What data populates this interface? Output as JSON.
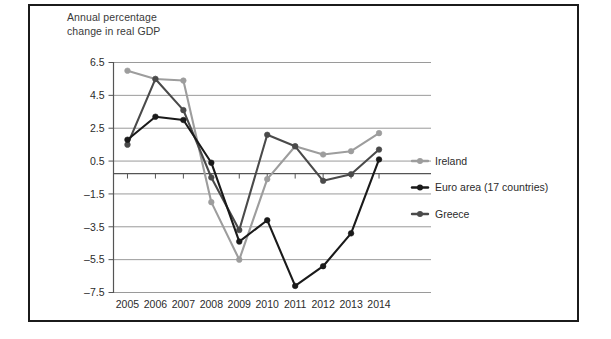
{
  "axis_title": "Annual percentage\nchange in real GDP",
  "legend": {
    "position": "right",
    "entries": [
      {
        "label": "Ireland",
        "color": "#9d9d9d"
      },
      {
        "label": "Euro area (17 countries)",
        "color": "#1a1a1a"
      },
      {
        "label": "Greece",
        "color": "#4a4a4a"
      }
    ]
  },
  "chart_data": {
    "type": "line",
    "title": "Annual percentage change in real GDP",
    "xlabel": "",
    "ylabel": "Annual percentage change in real GDP",
    "categories": [
      "2005",
      "2006",
      "2007",
      "2008",
      "2009",
      "2010",
      "2011",
      "2012",
      "2013",
      "2014"
    ],
    "ylim": [
      -7.5,
      6.5
    ],
    "yticks": [
      6.5,
      4.5,
      2.5,
      0.5,
      -1.5,
      -3.5,
      -5.5,
      -7.5
    ],
    "ytick_labels": [
      "6.5",
      "4.5",
      "2.5",
      "0.5",
      "–1.5",
      "–3.5",
      "–5.5",
      "–7.5"
    ],
    "grid": true,
    "series": [
      {
        "name": "Ireland",
        "color": "#9d9d9d",
        "values": [
          6.0,
          5.5,
          5.4,
          -2.0,
          -5.5,
          -0.6,
          1.4,
          0.9,
          1.1,
          2.2
        ]
      },
      {
        "name": "Euro area (17 countries)",
        "color": "#1a1a1a",
        "values": [
          1.8,
          3.2,
          3.0,
          0.4,
          -4.4,
          -3.1,
          -7.1,
          -5.9,
          -3.9,
          0.6
        ]
      },
      {
        "name": "Greece",
        "color": "#4a4a4a",
        "values": [
          1.5,
          5.5,
          3.6,
          -0.5,
          -3.7,
          2.1,
          1.4,
          -0.7,
          -0.3,
          1.2
        ]
      }
    ]
  }
}
